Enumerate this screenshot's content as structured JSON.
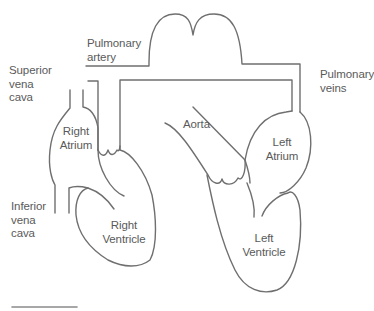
{
  "diagram": {
    "type": "anatomy-schematic",
    "line_color": "#6f6f6f",
    "text_color": "#5a5a5a",
    "labels": {
      "pulmonary_artery": "Pulmonary\nartery",
      "superior_vena_cava": "Superior\nvena\ncava",
      "pulmonary_veins": "Pulmonary\nveins",
      "right_atrium": "Right\nAtrium",
      "aorta": "Aorta",
      "left_atrium": "Left\nAtrium",
      "inferior_vena_cava": "Inferior\nvena\ncava",
      "right_ventricle": "Right\nVentricle",
      "left_ventricle": "Left\nVentricle"
    }
  }
}
